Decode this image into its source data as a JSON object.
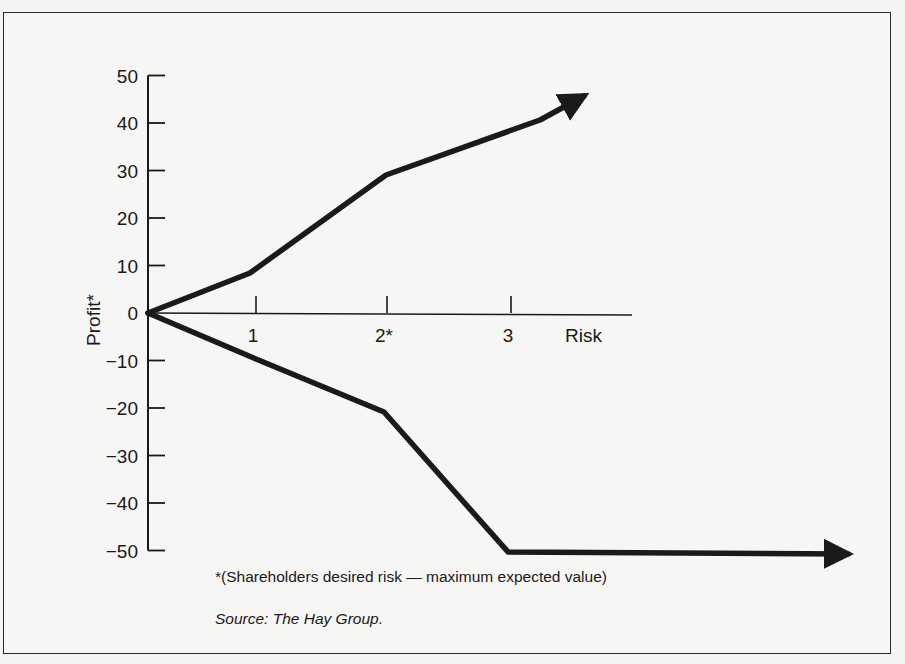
{
  "figure": {
    "footnote": "*(Shareholders desired risk — maximum expected value)",
    "source": "Source:  The Hay Group."
  },
  "chart_data": {
    "type": "line",
    "title": "",
    "xlabel": "Risk",
    "ylabel": "Profit*",
    "xlim": [
      0,
      4.6
    ],
    "ylim": [
      -50,
      50
    ],
    "x_ticks": [
      "1",
      "2*",
      "3"
    ],
    "y_ticks": [
      "50",
      "40",
      "30",
      "20",
      "10",
      "0",
      "−10",
      "−20",
      "−30",
      "−40",
      "−50"
    ],
    "grid": false,
    "legend": null,
    "series": [
      {
        "name": "Upside (potential gain)",
        "x": [
          0,
          0.8,
          1.9,
          3.1,
          3.5
        ],
        "values": [
          0,
          8,
          29,
          40,
          46
        ],
        "arrow_end": true
      },
      {
        "name": "Downside (potential loss)",
        "x": [
          0,
          1.0,
          1.95,
          3.0,
          5.5
        ],
        "values": [
          0,
          -10,
          -21,
          -50,
          -50
        ],
        "arrow_end": true
      }
    ],
    "annotations": [
      "*(Shareholders desired risk — maximum expected value)",
      "Source: The Hay Group."
    ]
  }
}
